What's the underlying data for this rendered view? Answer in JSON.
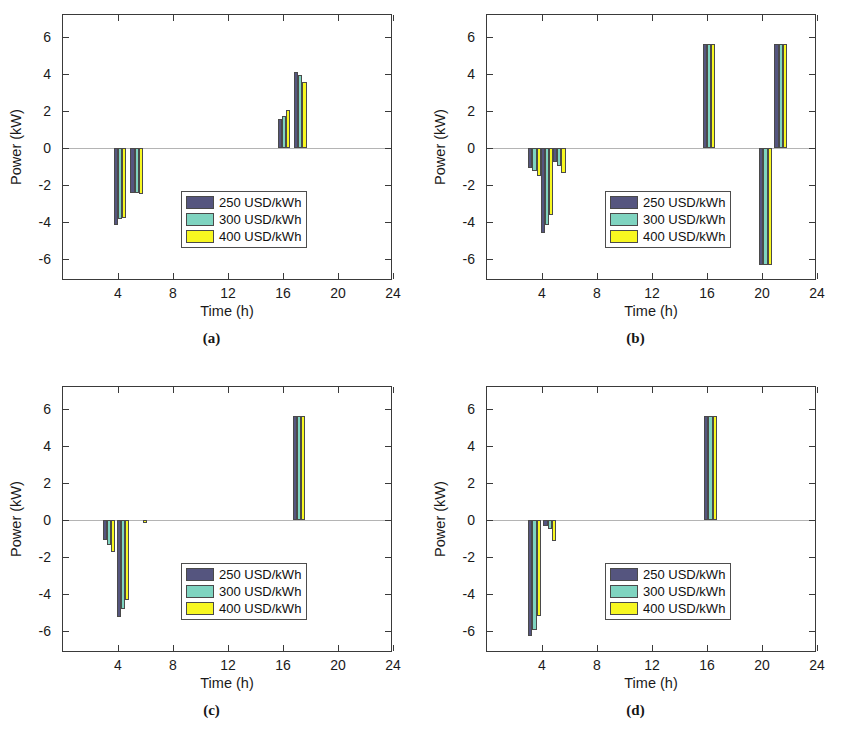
{
  "figure": {
    "width": 847,
    "height": 745,
    "background": "#ffffff"
  },
  "series_colors": {
    "s250": "#55557f",
    "s300": "#7fd4c0",
    "s400": "#f7f721",
    "edge": "#4a4a4a"
  },
  "legend": {
    "items": [
      {
        "label": "250 USD/kWh",
        "color": "#55557f"
      },
      {
        "label": "300 USD/kWh",
        "color": "#7fd4c0"
      },
      {
        "label": "400 USD/kWh",
        "color": "#f7f721"
      }
    ]
  },
  "axis": {
    "xlabel": "Time (h)",
    "ylabel": "Power (kW)",
    "xticks": [
      4,
      8,
      12,
      16,
      20,
      24
    ],
    "xtick_labels": [
      "4",
      "8",
      "12",
      "16",
      "20",
      "24"
    ],
    "yticks": [
      6,
      4,
      2,
      0,
      -2,
      -4,
      -6
    ],
    "ytick_labels": [
      "6",
      "4",
      "2",
      "0",
      "-2",
      "-4",
      "-6"
    ],
    "xlim": [
      0,
      24
    ],
    "ylim": [
      -7.2,
      7.2
    ],
    "grid": false
  },
  "captions": {
    "a": "(a)",
    "b": "(b)",
    "c": "(c)",
    "d": "(d)"
  },
  "chart_data": [
    {
      "id": "a",
      "type": "bar",
      "title": "(a)",
      "xlabel": "Time (h)",
      "ylabel": "Power (kW)",
      "xlim": [
        0,
        24
      ],
      "ylim": [
        -7.2,
        7.2
      ],
      "grid": false,
      "legend_position": "center",
      "categories": [
        3.7,
        4.9,
        15.6,
        16.8
      ],
      "series": [
        {
          "name": "250 USD/kWh",
          "color": "#55557f",
          "values": [
            -4.15,
            -2.45,
            1.55,
            4.1
          ]
        },
        {
          "name": "300 USD/kWh",
          "color": "#7fd4c0",
          "values": [
            -3.85,
            -2.45,
            1.75,
            3.95
          ]
        },
        {
          "name": "400 USD/kWh",
          "color": "#f7f721",
          "values": [
            -3.8,
            -2.5,
            2.05,
            3.6
          ]
        }
      ]
    },
    {
      "id": "b",
      "type": "bar",
      "title": "(b)",
      "xlabel": "Time (h)",
      "ylabel": "Power (kW)",
      "xlim": [
        0,
        24
      ],
      "ylim": [
        -7.2,
        7.2
      ],
      "grid": false,
      "legend_position": "center",
      "categories": [
        3.0,
        3.9,
        4.8,
        15.7,
        19.8,
        20.9
      ],
      "series": [
        {
          "name": "250 USD/kWh",
          "color": "#55557f",
          "values": [
            -1.1,
            -4.6,
            -0.75,
            5.65,
            -6.35,
            5.65
          ]
        },
        {
          "name": "300 USD/kWh",
          "color": "#7fd4c0",
          "values": [
            -1.25,
            -4.15,
            -0.95,
            5.65,
            -6.35,
            5.65
          ]
        },
        {
          "name": "400 USD/kWh",
          "color": "#f7f721",
          "values": [
            -1.5,
            -3.65,
            -1.35,
            5.65,
            -6.35,
            5.65
          ]
        }
      ]
    },
    {
      "id": "c",
      "type": "bar",
      "title": "(c)",
      "xlabel": "Time (h)",
      "ylabel": "Power (kW)",
      "xlim": [
        0,
        24
      ],
      "ylim": [
        -7.2,
        7.2
      ],
      "grid": false,
      "legend_position": "center",
      "categories": [
        2.9,
        3.9,
        5.2,
        16.7
      ],
      "series": [
        {
          "name": "250 USD/kWh",
          "color": "#55557f",
          "values": [
            -1.1,
            -5.25,
            0,
            5.65
          ]
        },
        {
          "name": "300 USD/kWh",
          "color": "#7fd4c0",
          "values": [
            -1.35,
            -4.8,
            0,
            5.65
          ]
        },
        {
          "name": "400 USD/kWh",
          "color": "#f7f721",
          "values": [
            -1.75,
            -4.35,
            -0.15,
            5.65
          ]
        }
      ]
    },
    {
      "id": "d",
      "type": "bar",
      "title": "(d)",
      "xlabel": "Time (h)",
      "ylabel": "Power (kW)",
      "xlim": [
        0,
        24
      ],
      "ylim": [
        -7.2,
        7.2
      ],
      "grid": false,
      "legend_position": "center",
      "categories": [
        3.0,
        4.1,
        15.8
      ],
      "series": [
        {
          "name": "250 USD/kWh",
          "color": "#55557f",
          "values": [
            -6.3,
            -0.3,
            5.65
          ]
        },
        {
          "name": "300 USD/kWh",
          "color": "#7fd4c0",
          "values": [
            -5.95,
            -0.5,
            5.65
          ]
        },
        {
          "name": "400 USD/kWh",
          "color": "#f7f721",
          "values": [
            -5.2,
            -1.15,
            5.65
          ]
        }
      ]
    }
  ]
}
